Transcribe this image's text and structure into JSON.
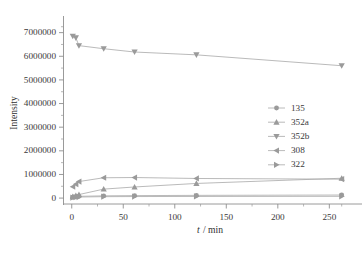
{
  "chart_data": {
    "type": "line",
    "title": "",
    "subtitle": "",
    "xlabel": "t / min",
    "xlabel_italic_part": "t",
    "xlabel_rest": "/ min",
    "ylabel": "Intensity",
    "xlim": [
      -8,
      272
    ],
    "ylim": [
      -250000,
      7450000
    ],
    "xticks": [
      0,
      50,
      100,
      150,
      200,
      250
    ],
    "xtick_labels": [
      "0",
      "50",
      "100",
      "150",
      "200",
      "250"
    ],
    "xminor_ticks": [
      25,
      75,
      125,
      175,
      225,
      262
    ],
    "yticks": [
      0,
      1000000,
      2000000,
      3000000,
      4000000,
      5000000,
      6000000,
      7000000
    ],
    "ytick_labels": [
      "0",
      "1000000",
      "2000000",
      "3000000",
      "4000000",
      "5000000",
      "6000000",
      "7000000"
    ],
    "yminor_ticks": [
      500000,
      1500000,
      2500000,
      3500000,
      4500000,
      5500000,
      6500000,
      7250000
    ],
    "grid": false,
    "legend_position": "right-middle",
    "marker_color": "#9a9a9a",
    "line_color": "#a8a8a8",
    "axis_color": "#8e8e8e",
    "series": [
      {
        "name": "135",
        "marker": "circle",
        "x": [
          1,
          4,
          7,
          31,
          61,
          121,
          262
        ],
        "values": [
          40000,
          60000,
          75000,
          95000,
          105000,
          115000,
          130000
        ]
      },
      {
        "name": "352a",
        "marker": "triangle-up",
        "x": [
          1,
          4,
          7,
          31,
          61,
          121,
          262
        ],
        "values": [
          60000,
          110000,
          150000,
          380000,
          470000,
          620000,
          840000
        ]
      },
      {
        "name": "352b",
        "marker": "triangle-down",
        "x": [
          1,
          4,
          7,
          31,
          61,
          121,
          262
        ],
        "values": [
          6850000,
          6780000,
          6450000,
          6320000,
          6180000,
          6060000,
          5600000
        ]
      },
      {
        "name": "308",
        "marker": "triangle-left",
        "x": [
          1,
          4,
          7,
          31,
          61,
          121,
          262
        ],
        "values": [
          480000,
          590000,
          700000,
          860000,
          870000,
          830000,
          800000
        ]
      },
      {
        "name": "322",
        "marker": "triangle-right",
        "x": [
          1,
          4,
          7,
          31,
          61,
          121,
          262
        ],
        "values": [
          20000,
          35000,
          45000,
          60000,
          65000,
          70000,
          75000
        ]
      }
    ],
    "legend_entries": [
      {
        "label": "135",
        "marker": "circle"
      },
      {
        "label": "352a",
        "marker": "triangle-up"
      },
      {
        "label": "352b",
        "marker": "triangle-down"
      },
      {
        "label": "308",
        "marker": "triangle-left"
      },
      {
        "label": "322",
        "marker": "triangle-right"
      }
    ]
  }
}
